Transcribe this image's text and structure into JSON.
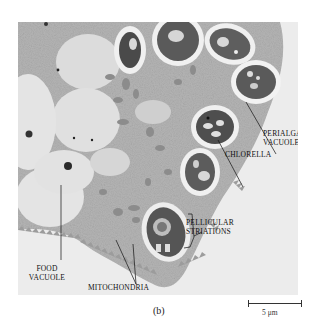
{
  "figure": {
    "panel_caption": "(b)",
    "scale_bar": {
      "label": "5 μm",
      "length_px": 54
    },
    "labels": {
      "perialgal_vacuole_line1": "PERIALGAL",
      "perialgal_vacuole_line2": "VACUOLE",
      "chlorella": "CHLORELLA",
      "pellicular_striations_line1": "PELLICULAR",
      "pellicular_striations_line2": "STRIATIONS",
      "food_vacuole_line1": "FOOD",
      "food_vacuole_line2": "VACUOLE",
      "mitochondria": "MITOCHONDRIA"
    },
    "colors": {
      "cytoplasm": "#b8b8b8",
      "vacuole": "#e2e2e2",
      "chlorella": "#5a5a5a",
      "background": "#ececec",
      "label_text": "#111111"
    }
  }
}
